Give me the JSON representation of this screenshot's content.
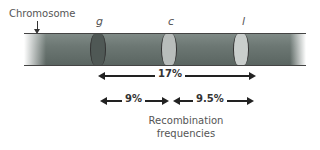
{
  "labels": {
    "chromosome": "Chromosome",
    "caption_line1": "Recombination",
    "caption_line2": "frequencies"
  },
  "genes": [
    {
      "name": "g",
      "band_color": "#4f5855"
    },
    {
      "name": "c",
      "band_color": "#b8bdbb"
    },
    {
      "name": "l",
      "band_color": "#c9cecc"
    }
  ],
  "distances": {
    "g_to_l": "17%",
    "g_to_c": "9%",
    "c_to_l": "9.5%"
  },
  "colors": {
    "chromosome_body": "#6c7773",
    "arrow": "#222222"
  }
}
